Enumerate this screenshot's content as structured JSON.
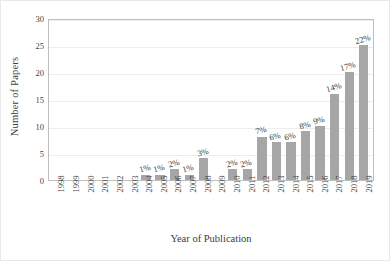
{
  "chart_data": {
    "type": "bar",
    "title": "",
    "xlabel": "Year of Publication",
    "ylabel": "Number of Papers",
    "ylim": [
      0,
      30
    ],
    "yticks": [
      0,
      5,
      10,
      15,
      20,
      25,
      30
    ],
    "grid": true,
    "legend": null,
    "bar_color": "#A6A6A6",
    "categories": [
      "1998",
      "1999",
      "2000",
      "2001",
      "2002",
      "2003",
      "2004",
      "2005",
      "2006",
      "2007",
      "2008",
      "2009",
      "2010",
      "2011",
      "2012",
      "2013",
      "2014",
      "2015",
      "2016",
      "2017",
      "2018",
      "2019"
    ],
    "values": [
      0,
      0,
      0,
      0,
      0,
      0,
      1,
      1,
      2,
      1,
      4,
      0,
      2,
      2,
      8,
      7,
      7,
      9,
      10,
      16,
      20,
      25
    ],
    "data_labels": [
      "",
      "",
      "",
      "",
      "",
      "",
      "1%",
      "1%",
      "2%",
      "1%",
      "3%",
      "",
      "2%",
      "2%",
      "7%",
      "6%",
      "6%",
      "8%",
      "9%",
      "14%",
      "17%",
      "22%"
    ]
  }
}
